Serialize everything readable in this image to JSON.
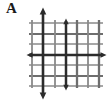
{
  "figure": {
    "panel_label": "A",
    "label_position": "top-left",
    "background_color": "#ffffff",
    "width": 111,
    "height": 104
  },
  "diagram": {
    "type": "lattice-grid-with-direction-arrows",
    "grid": {
      "vertical_line_count": 7,
      "horizontal_line_count": 7,
      "thin_line_color": "#808080",
      "thin_line_width": 1.6,
      "bold_line_color": "#3a3a3a",
      "bold_line_width": 2.6,
      "x_left": 29,
      "x_right": 103,
      "y_top": 20,
      "y_bottom": 88,
      "vertical_x": [
        32,
        43,
        55,
        66,
        77,
        88,
        99
      ],
      "horizontal_y": [
        23,
        34,
        44,
        55,
        65,
        76,
        86
      ],
      "bold_vertical_index": [
        1,
        3,
        5
      ],
      "bold_horizontal_index": [
        1,
        3,
        5
      ]
    },
    "arrows": [
      {
        "name": "arrow-up-main",
        "direction": "up",
        "axis": "vertical",
        "line_x": 43,
        "tip_y": 8,
        "tail_y": 88,
        "bold": true,
        "color": "#2b2b2b"
      },
      {
        "name": "arrow-up-secondary",
        "direction": "up",
        "axis": "vertical",
        "line_x": 66,
        "tip_y": 20,
        "tail_y": 88,
        "bold": true,
        "color": "#2b2b2b"
      },
      {
        "name": "arrow-down-main",
        "direction": "down",
        "axis": "vertical",
        "line_x": 43,
        "tip_y": 98,
        "tail_y": 20,
        "bold": true,
        "color": "#2b2b2b"
      },
      {
        "name": "arrow-down-secondary",
        "direction": "down",
        "axis": "vertical",
        "line_x": 66,
        "tip_y": 90,
        "tail_y": 20,
        "bold": true,
        "color": "#2b2b2b"
      },
      {
        "name": "arrow-left",
        "direction": "left",
        "axis": "horizontal",
        "line_y": 55,
        "tip_x": 26,
        "tail_x": 103,
        "bold": true,
        "color": "#2b2b2b"
      },
      {
        "name": "arrow-right",
        "direction": "right",
        "axis": "horizontal",
        "line_y": 55,
        "tip_x": 106,
        "tail_x": 29,
        "bold": true,
        "color": "#2b2b2b"
      }
    ]
  }
}
